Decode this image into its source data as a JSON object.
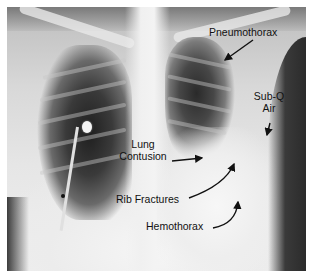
{
  "figure": {
    "type": "chest radiograph (AP)",
    "background_color": "#ffffff",
    "text_color": "#111111"
  },
  "labels": {
    "pneumothorax": "Pneumothorax",
    "subq_line1": "Sub-Q",
    "subq_line2": "Air",
    "lung_line1": "Lung",
    "lung_line2": "Contusion",
    "rib_fractures": "Rib Fractures",
    "hemothorax": "Hemothorax"
  }
}
